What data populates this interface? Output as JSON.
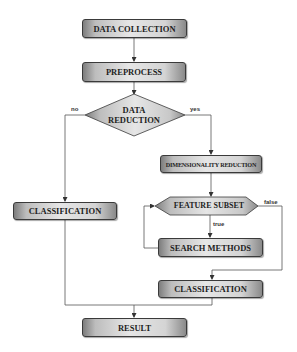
{
  "diagram": {
    "type": "flowchart",
    "nodes": {
      "data_collection": {
        "label": "DATA COLLECTION",
        "shape": "process"
      },
      "preprocess": {
        "label": "PREPROCESS",
        "shape": "process"
      },
      "data_reduction": {
        "line1": "DATA",
        "line2": "REDUCTION",
        "shape": "decision"
      },
      "dimensionality_reduction": {
        "label": "DIMENSIONALITY REDUCTION",
        "shape": "process"
      },
      "feature_subset": {
        "label": "FEATURE SUBSET",
        "shape": "preparation"
      },
      "search_methods": {
        "label": "SEARCH METHODS",
        "shape": "process"
      },
      "classification_left": {
        "label": "CLASSIFICATION",
        "shape": "process"
      },
      "classification_right": {
        "label": "CLASSIFICATION",
        "shape": "process"
      },
      "result": {
        "label": "RESULT",
        "shape": "process"
      }
    },
    "edge_labels": {
      "no": "no",
      "yes": "yes",
      "true": "true",
      "false": "false"
    },
    "edges": [
      {
        "from": "DATA COLLECTION",
        "to": "PREPROCESS"
      },
      {
        "from": "PREPROCESS",
        "to": "DATA REDUCTION"
      },
      {
        "from": "DATA REDUCTION",
        "to": "CLASSIFICATION (left)",
        "label": "no"
      },
      {
        "from": "DATA REDUCTION",
        "to": "DIMENSIONALITY REDUCTION",
        "label": "yes"
      },
      {
        "from": "DIMENSIONALITY REDUCTION",
        "to": "FEATURE SUBSET"
      },
      {
        "from": "FEATURE SUBSET",
        "to": "SEARCH METHODS",
        "label": "true"
      },
      {
        "from": "SEARCH METHODS",
        "to": "FEATURE SUBSET"
      },
      {
        "from": "FEATURE SUBSET",
        "to": "CLASSIFICATION (right)",
        "label": "false"
      },
      {
        "from": "CLASSIFICATION (left)",
        "to": "RESULT"
      },
      {
        "from": "CLASSIFICATION (right)",
        "to": "RESULT"
      }
    ]
  },
  "colors": {
    "line": "#555555",
    "box_border": "#3a3a3a",
    "box_fill_light": "#e6e6e6",
    "box_fill_dark": "#7d7d7d",
    "text": "#1e1e1e"
  }
}
